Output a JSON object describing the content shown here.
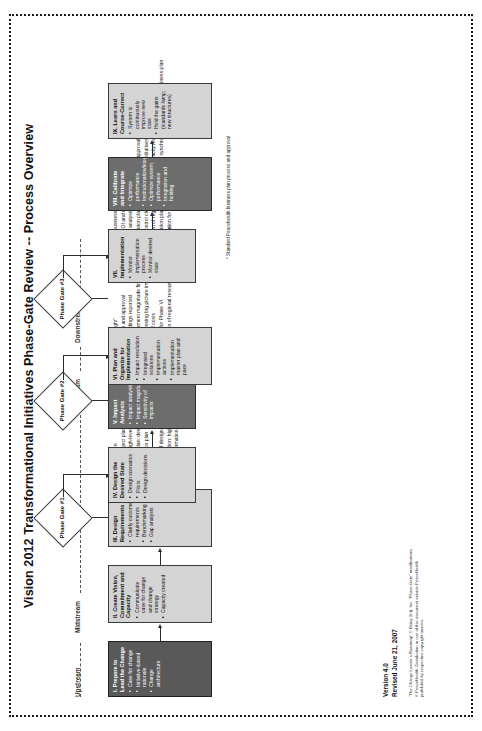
{
  "document": {
    "title": "Vision 2012 Transformational Initiatives Phase-Gate Review -- Process Overview"
  },
  "lanes": [
    {
      "id": "upstream",
      "label": "Upstream"
    },
    {
      "id": "midstream1",
      "label": "Midstream"
    },
    {
      "id": "midstream2",
      "label": "Midstream"
    },
    {
      "id": "downstream",
      "label": "Downstream"
    }
  ],
  "stages": [
    {
      "id": "stage-1",
      "title": "I. Prepare to Lead the Change",
      "style": "darker",
      "bullets": [
        "Case for change",
        "Initiative-based rationale",
        "Change architecture"
      ]
    },
    {
      "id": "stage-2",
      "title": "II. Create Vision, Commitment and Capacity",
      "style": "light",
      "bullets": [
        "Communicate case for change and change strategy",
        "Capacity created"
      ]
    },
    {
      "id": "stage-3",
      "title": "III. Design Requirements",
      "style": "light",
      "bullets": [
        "Clarify customer requirements",
        "Benchmarking",
        "Gap analysis"
      ]
    },
    {
      "id": "stage-4",
      "title": "IV. Design the Desired State",
      "style": "light",
      "bullets": [
        "Design scenarios",
        "Pilots",
        "Design decisions"
      ]
    },
    {
      "id": "stage-5",
      "title": "V. Impact Analysis",
      "style": "dark",
      "bullets": [
        "Impact analysis",
        "Impact magnitude",
        "Sensitivity of impacts"
      ]
    },
    {
      "id": "stage-6",
      "title": "VI. Plan and Organize for Implementation",
      "style": "light",
      "bullets": [
        "Impact resolution",
        "Integrated solutions",
        "Implementation actions",
        "Implementation master plan and pace"
      ]
    },
    {
      "id": "stage-7",
      "title": "VII. Implementation",
      "style": "light",
      "bullets": [
        "Monitor implementation process",
        "Monitor desired state"
      ]
    },
    {
      "id": "stage-8",
      "title": "VIII. Calibrate and Integrate",
      "style": "dark",
      "bullets": [
        "Optimize performance",
        "Institutionalize/integrate",
        "Optimize system performance",
        "Integration and holding"
      ]
    },
    {
      "id": "stage-9",
      "title": "IX. Learn and Course-Correct",
      "style": "light",
      "bullets": [
        "System to continuously improve new state",
        "Hold  the gains (standards /amp; new structures)"
      ]
    }
  ],
  "gates": [
    {
      "id": "gate-1",
      "label": "Phase Gate #1"
    },
    {
      "id": "gate-2",
      "label": "Phase Gate #2"
    },
    {
      "id": "gate-3",
      "label": "Phase Gate #3"
    }
  ],
  "gate_criteria": [
    {
      "id": "gate-1-criteria",
      "items": [
        "Clarity of vision",
        "High-level project plan",
        "Preliminary, high-level impact analysis",
        "Involvement plan: design and launch",
        "Communication plan",
        "Capacity plan",
        "Preliminary v4 design requirements",
        "Value proposition: high-level ROI/VOI metrics",
        "$$ used: confirmation for Phases IV and V"
      ]
    },
    {
      "id": "gate-2-criteria",
      "items": [
        "Phase gate \"light\"",
        "Design review and approval",
        "Pilot study findings reported",
        "Impact assessment magnitude findings",
        "Plan for addressing big picture impacts",
        "Refinement of costs",
        "Confirmation for Phase VI",
        "Reconfirmation of regional resources & capacity readiness"
      ]
    },
    {
      "id": "gate-3-criteria",
      "items": [
        "Approved business plan required *",
        "Finalized ROI and metrics",
        "Full impact analysis and mitigation plan",
        "Implementation plan and pace review and approval",
        "Air traffic control clearance vis-a-vis other initiatives and PMI work",
        "Confirmation of regional resources and capacity readiness",
        "Implementation plan costs re-validated and synchronized with approved business plan",
        "$$ confirmation for Phases VII, VIII, and IX"
      ]
    }
  ],
  "footnote": "* Standard Peacehealth business plan process and approval",
  "version": {
    "line1": "Version 4.0",
    "line2": "Revised June 21, 2007"
  },
  "legal": "“The Change Leader’s Roadmap” © Being (Int), Inc. “Phase-Gate” modifications © PeaceHealth. Distribution or use of this document outside PeaceHealth prohibited by respective copyright owners."
}
